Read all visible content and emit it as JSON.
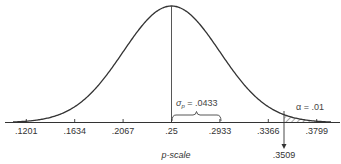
{
  "chart_data": {
    "type": "area",
    "title": "",
    "xlabel": "p-scale",
    "ylabel": "",
    "distribution": "normal",
    "mean": 0.25,
    "sigma": 0.0433,
    "x_ticks": [
      0.1201,
      0.1634,
      0.2067,
      0.25,
      0.2933,
      0.3366,
      0.3799
    ],
    "tick_labels": [
      ".1201",
      ".1634",
      ".2067",
      ".25",
      ".2933",
      ".3366",
      ".3799"
    ],
    "critical_value": 0.3509,
    "critical_label": ".3509",
    "shaded_region": {
      "from": 0.3509,
      "to": "right tail",
      "area": 0.01,
      "pattern": "diagonal hatch"
    },
    "annotations": [
      {
        "text": "σp = .0433",
        "meaning": "standard error shown by brace from .25 to .2933"
      },
      {
        "text": "α = .01",
        "meaning": "shaded right-tail rejection region"
      }
    ],
    "grid": false,
    "legend": null
  },
  "labels": {
    "xlabel": "p-scale",
    "sigma_symbol": "σ",
    "sigma_sub": "p",
    "sigma_value": " = .0433",
    "alpha_text": "α = .01",
    "critical": ".3509",
    "ticks": [
      ".1201",
      ".1634",
      ".2067",
      ".25",
      ".2933",
      ".3366",
      ".3799"
    ]
  },
  "colors": {
    "line": "#333333",
    "hatch": "#555555"
  }
}
